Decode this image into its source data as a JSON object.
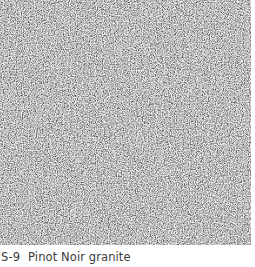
{
  "sample": {
    "code": "S-9",
    "name": "Pinot Noir granite",
    "texture": "granite-speckle",
    "colors": {
      "base": "#7a7a7a",
      "dark": "#141414",
      "light": "#f2f2f2",
      "caption": "#3a3a3a"
    }
  }
}
